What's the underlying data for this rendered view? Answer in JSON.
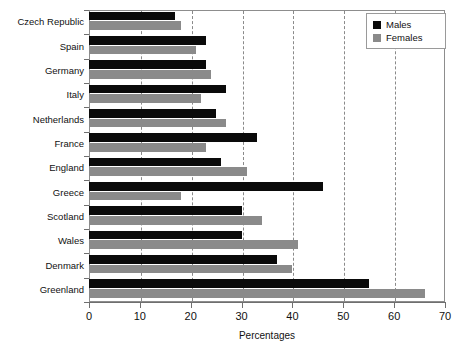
{
  "chart_data": {
    "type": "bar",
    "orientation": "horizontal",
    "title": "",
    "xlabel": "Percentages",
    "ylabel": "",
    "xlim": [
      0,
      70
    ],
    "xticks": [
      0,
      10,
      20,
      30,
      40,
      50,
      60,
      70
    ],
    "xtick_labels": [
      "0",
      "10",
      "20",
      "30",
      "40",
      "50",
      "60",
      "70"
    ],
    "grid": "vertical-dashed",
    "legend_position": "top-right",
    "categories": [
      "Czech Republic",
      "Spain",
      "Germany",
      "Italy",
      "Netherlands",
      "France",
      "England",
      "Greece",
      "Scotland",
      "Wales",
      "Denmark",
      "Greenland"
    ],
    "series": [
      {
        "name": "Males",
        "color": "#0a0a0a",
        "values": [
          17,
          23,
          23,
          27,
          25,
          33,
          26,
          46,
          30,
          30,
          37,
          55
        ]
      },
      {
        "name": "Females",
        "color": "#8a8a8a",
        "values": [
          18,
          21,
          24,
          22,
          27,
          23,
          31,
          18,
          34,
          41,
          40,
          66
        ]
      }
    ]
  },
  "legend": {
    "items": [
      {
        "label": "Males",
        "swatch": "male"
      },
      {
        "label": "Females",
        "swatch": "female"
      }
    ]
  },
  "colors": {
    "males": "#0a0a0a",
    "females": "#8a8a8a",
    "axis": "#6f6f6f",
    "grid": "#8a8a8a",
    "background": "#ffffff"
  }
}
